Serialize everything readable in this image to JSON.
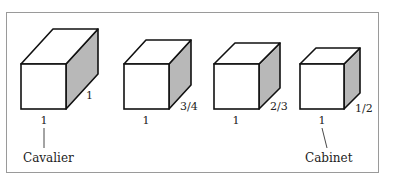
{
  "diagram": {
    "type": "oblique-projection-comparison",
    "shade_color": "#b8b8b8",
    "line_color": "#111111",
    "frame_color": "#9a9a9a",
    "cubes": [
      {
        "name": "cavalier",
        "front_label": "1",
        "depth_label": "1",
        "caption": "Cavalier",
        "front": {
          "x": 21,
          "y": 64,
          "w": 45,
          "h": 45
        },
        "offset": {
          "dx": 32,
          "dy": -35
        },
        "front_label_pos": [
          44,
          124
        ],
        "depth_label_pos": [
          86,
          99
        ],
        "caption_pos": [
          23,
          162
        ],
        "leader": [
          [
            44,
            128
          ],
          [
            44,
            148
          ]
        ]
      },
      {
        "name": "three-quarter",
        "front_label": "1",
        "depth_label": "3/4",
        "caption": "",
        "front": {
          "x": 124,
          "y": 64,
          "w": 45,
          "h": 45
        },
        "offset": {
          "dx": 22,
          "dy": -24
        },
        "front_label_pos": [
          146,
          124
        ],
        "depth_label_pos": [
          180,
          110
        ]
      },
      {
        "name": "two-thirds",
        "front_label": "1",
        "depth_label": "2/3",
        "caption": "",
        "front": {
          "x": 214,
          "y": 64,
          "w": 45,
          "h": 45
        },
        "offset": {
          "dx": 21,
          "dy": -21
        },
        "front_label_pos": [
          236,
          124
        ],
        "depth_label_pos": [
          270,
          110
        ]
      },
      {
        "name": "cabinet",
        "front_label": "1",
        "depth_label": "1/2",
        "caption": "Cabinet",
        "front": {
          "x": 300,
          "y": 64,
          "w": 44,
          "h": 45
        },
        "offset": {
          "dx": 16,
          "dy": -16
        },
        "front_label_pos": [
          322,
          124
        ],
        "depth_label_pos": [
          355,
          112
        ],
        "caption_pos": [
          305,
          162
        ],
        "leader": [
          [
            322,
            128
          ],
          [
            327,
            148
          ]
        ]
      }
    ]
  }
}
